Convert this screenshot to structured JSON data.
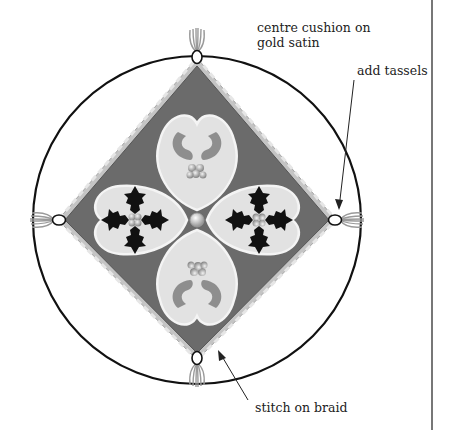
{
  "diagram": {
    "colors": {
      "outline": "#111111",
      "diamond_fill": "#6b6b6b",
      "braid": "#bdbdbd",
      "heart_fill": "#e2e2e2",
      "scroll": "#8e8e8e",
      "holly": "#111111",
      "berry": "#c9c9c9",
      "tassel": "#9a9a9a",
      "divider": "#555555"
    },
    "labels": {
      "centre_line1": "centre cushion on",
      "centre_line2": "gold satin",
      "tassels": "add tassels",
      "braid": "stitch on braid"
    },
    "motifs": {
      "holly_hearts": 2,
      "scroll_hearts": 2,
      "tassels": 4,
      "centre_bead": 1
    }
  }
}
